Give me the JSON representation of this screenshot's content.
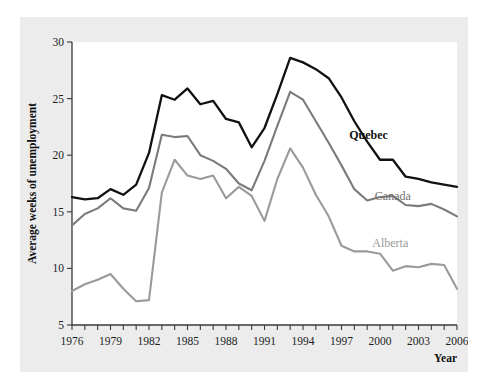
{
  "chart_data": {
    "type": "line",
    "title": "",
    "xlabel": "Year",
    "ylabel": "Average weeks of unemployment",
    "xlim": [
      1976,
      2006
    ],
    "ylim": [
      5,
      30
    ],
    "yticks": [
      5,
      10,
      15,
      20,
      25,
      30
    ],
    "xticks": [
      1976,
      1979,
      1982,
      1985,
      1988,
      1991,
      1994,
      1997,
      2000,
      2003,
      2006
    ],
    "xtick_labels": [
      "1976",
      "1979",
      "1982",
      "1985",
      "1988",
      "1991",
      "1994",
      "1997",
      "2000",
      "2003",
      "2006"
    ],
    "ytick_labels": [
      "5",
      "10",
      "15",
      "20",
      "25",
      "30"
    ],
    "grid": false,
    "legend_position": "inline-end-labels",
    "x": [
      1976,
      1977,
      1978,
      1979,
      1980,
      1981,
      1982,
      1983,
      1984,
      1985,
      1986,
      1987,
      1988,
      1989,
      1990,
      1991,
      1992,
      1993,
      1994,
      1995,
      1996,
      1997,
      1998,
      1999,
      2000,
      2001,
      2002,
      2003,
      2004,
      2005,
      2006
    ],
    "series": [
      {
        "name": "Quebec",
        "color": "#111111",
        "values": [
          16.3,
          16.1,
          16.2,
          17.0,
          16.5,
          17.4,
          20.2,
          25.3,
          24.9,
          25.9,
          24.5,
          24.8,
          23.2,
          22.9,
          20.7,
          22.4,
          25.4,
          28.6,
          28.2,
          27.6,
          26.8,
          25.1,
          23.0,
          21.2,
          19.6,
          19.6,
          18.1,
          17.9,
          17.6,
          17.4,
          17.2
        ]
      },
      {
        "name": "Canada",
        "color": "#7b7b7b",
        "values": [
          13.8,
          14.8,
          15.3,
          16.2,
          15.3,
          15.1,
          17.1,
          21.8,
          21.6,
          21.7,
          20.0,
          19.5,
          18.8,
          17.5,
          16.9,
          19.5,
          22.6,
          25.6,
          24.9,
          23.0,
          21.1,
          19.1,
          17.0,
          16.0,
          16.3,
          16.4,
          15.6,
          15.5,
          15.7,
          15.2,
          14.6
        ]
      },
      {
        "name": "Alberta",
        "color": "#9a9a9a",
        "values": [
          8.0,
          8.6,
          9.0,
          9.5,
          8.2,
          7.1,
          7.2,
          16.7,
          19.6,
          18.2,
          17.9,
          18.2,
          16.2,
          17.2,
          16.4,
          14.2,
          17.9,
          20.6,
          18.9,
          16.5,
          14.6,
          12.0,
          11.5,
          11.5,
          11.3,
          9.8,
          10.2,
          10.1,
          10.4,
          10.3,
          8.2
        ]
      }
    ],
    "annotations": [
      {
        "text": "Quebec",
        "x": 1997.6,
        "y": 21.4
      },
      {
        "text": "Canada",
        "x": 1999.6,
        "y": 16.0
      },
      {
        "text": "Alberta",
        "x": 1999.4,
        "y": 11.9
      }
    ]
  }
}
